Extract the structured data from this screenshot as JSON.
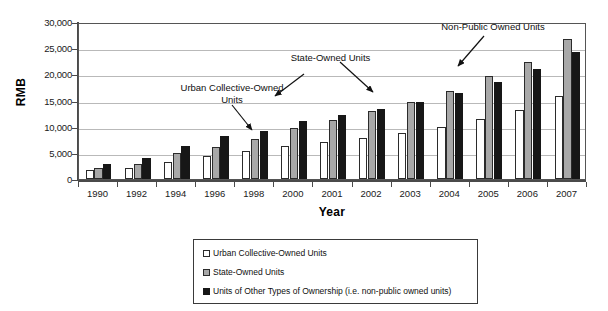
{
  "chart_data": {
    "type": "bar",
    "title": "",
    "xlabel": "Year",
    "ylabel": "RMB",
    "ylim": [
      0,
      30000
    ],
    "yticks": [
      0,
      5000,
      10000,
      15000,
      20000,
      25000,
      30000
    ],
    "ytick_labels": [
      "0",
      "5,000",
      "10,000",
      "15,000",
      "20,000",
      "25,000",
      "30,000"
    ],
    "grid": true,
    "legend_position": "bottom",
    "categories": [
      "1990",
      "1992",
      "1994",
      "1996",
      "1998",
      "2000",
      "2001",
      "2002",
      "2003",
      "2004",
      "2005",
      "2006",
      "2007"
    ],
    "series": [
      {
        "name": "Urban Collective-Owned Units",
        "color": "#ffffff",
        "values": [
          1700,
          2100,
          3300,
          4400,
          5400,
          6300,
          7000,
          7800,
          8800,
          10000,
          11500,
          13200,
          15800
        ]
      },
      {
        "name": "State-Owned Units",
        "color": "#a8a8a8",
        "values": [
          2200,
          2900,
          4900,
          6200,
          7700,
          9700,
          11300,
          13000,
          14700,
          16900,
          19600,
          22300,
          26800
        ]
      },
      {
        "name": "Units of Other Types of Ownership (i.e. non-public owned units)",
        "color": "#171717",
        "values": [
          2900,
          4000,
          6300,
          8300,
          9200,
          11100,
          12300,
          13400,
          14800,
          16500,
          18500,
          21000,
          24300
        ]
      }
    ],
    "annotations": [
      {
        "text": "Urban Collective-Owned\nUnits",
        "line1": "Urban Collective-Owned",
        "line2": "Units"
      },
      {
        "text": "State-Owned Units",
        "line1": "State-Owned Units",
        "line2": ""
      },
      {
        "text": "Non-Public Owned Units",
        "line1": "Non-Public Owned Units",
        "line2": ""
      }
    ]
  },
  "legend": {
    "items": [
      {
        "label": "Urban Collective-Owned Units"
      },
      {
        "label": "State-Owned Units"
      },
      {
        "label": "Units of Other Types of Ownership (i.e. non-public owned units)"
      }
    ]
  }
}
